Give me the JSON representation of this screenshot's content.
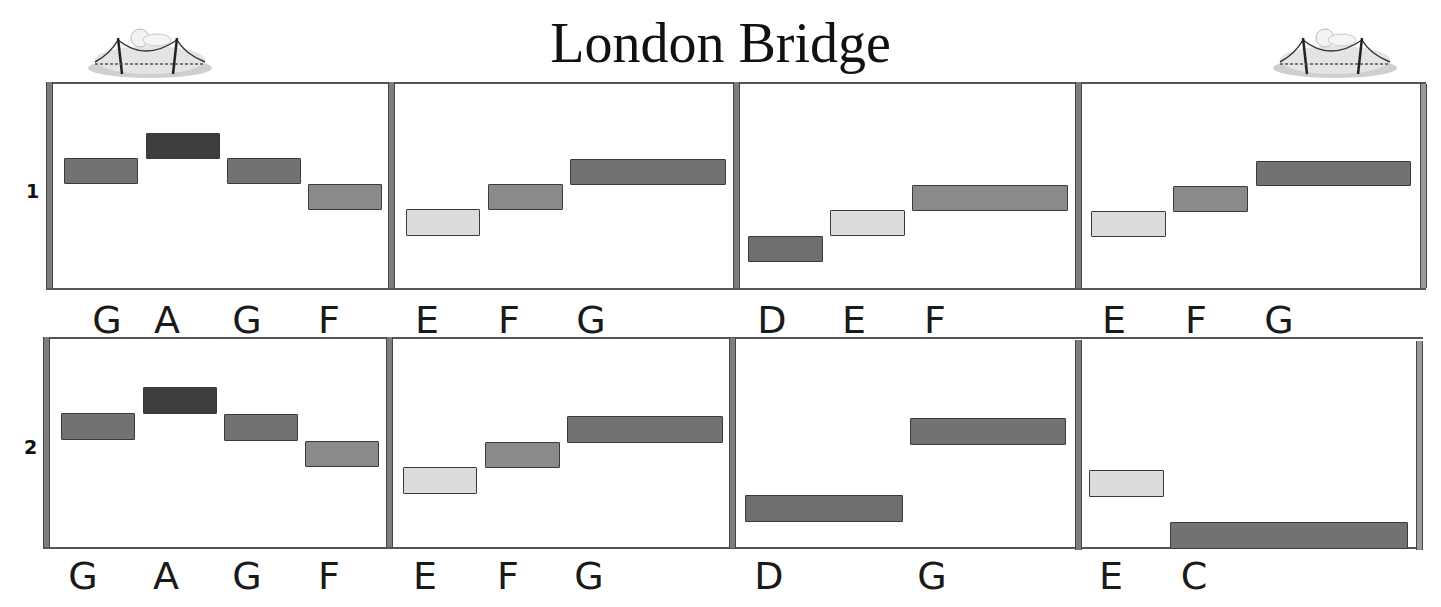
{
  "title": "London Bridge",
  "logos": [
    {
      "name": "bridge-illustration-left",
      "icon": "bridge-icon"
    },
    {
      "name": "bridge-illustration-right",
      "icon": "bridge-icon"
    }
  ],
  "rows": [
    {
      "label": "1",
      "measures": [
        {
          "notes": [
            {
              "pitch": "G",
              "x": 64,
              "y": 158,
              "w": 74,
              "h": 26,
              "shade": "mid"
            },
            {
              "pitch": "A",
              "x": 146,
              "y": 133,
              "w": 74,
              "h": 26,
              "shade": "dark"
            },
            {
              "pitch": "G",
              "x": 227,
              "y": 158,
              "w": 74,
              "h": 26,
              "shade": "mid"
            },
            {
              "pitch": "F",
              "x": 308,
              "y": 184,
              "w": 74,
              "h": 26,
              "shade": "midlight"
            }
          ],
          "labels": [
            {
              "text": "G",
              "x": 96
            },
            {
              "text": "A",
              "x": 156
            },
            {
              "text": "G",
              "x": 236
            },
            {
              "text": "F",
              "x": 318
            }
          ]
        },
        {
          "notes": [
            {
              "pitch": "E",
              "x": 406,
              "y": 209,
              "w": 74,
              "h": 27,
              "shade": "light"
            },
            {
              "pitch": "F",
              "x": 488,
              "y": 184,
              "w": 75,
              "h": 26,
              "shade": "midlight"
            },
            {
              "pitch": "G",
              "x": 570,
              "y": 159,
              "w": 156,
              "h": 26,
              "shade": "mid"
            }
          ],
          "labels": [
            {
              "text": "E",
              "x": 416
            },
            {
              "text": "F",
              "x": 498
            },
            {
              "text": "G",
              "x": 580
            }
          ]
        },
        {
          "notes": [
            {
              "pitch": "D",
              "x": 748,
              "y": 236,
              "w": 75,
              "h": 26,
              "shade": "low"
            },
            {
              "pitch": "E",
              "x": 830,
              "y": 210,
              "w": 75,
              "h": 26,
              "shade": "light"
            },
            {
              "pitch": "F",
              "x": 912,
              "y": 185,
              "w": 156,
              "h": 26,
              "shade": "midlight"
            }
          ],
          "labels": [
            {
              "text": "D",
              "x": 761
            },
            {
              "text": "E",
              "x": 843
            },
            {
              "text": "F",
              "x": 924
            }
          ]
        },
        {
          "notes": [
            {
              "pitch": "E",
              "x": 1091,
              "y": 211,
              "w": 75,
              "h": 26,
              "shade": "light"
            },
            {
              "pitch": "F",
              "x": 1173,
              "y": 186,
              "w": 75,
              "h": 26,
              "shade": "midlight"
            },
            {
              "pitch": "G",
              "x": 1256,
              "y": 161,
              "w": 155,
              "h": 25,
              "shade": "mid"
            }
          ],
          "labels": [
            {
              "text": "E",
              "x": 1103
            },
            {
              "text": "F",
              "x": 1185
            },
            {
              "text": "G",
              "x": 1268
            }
          ]
        }
      ]
    },
    {
      "label": "2",
      "measures": [
        {
          "notes": [
            {
              "pitch": "G",
              "x": 61,
              "y": 413,
              "w": 74,
              "h": 27,
              "shade": "mid"
            },
            {
              "pitch": "A",
              "x": 143,
              "y": 387,
              "w": 74,
              "h": 27,
              "shade": "dark"
            },
            {
              "pitch": "G",
              "x": 224,
              "y": 414,
              "w": 74,
              "h": 27,
              "shade": "mid"
            },
            {
              "pitch": "F",
              "x": 305,
              "y": 441,
              "w": 74,
              "h": 26,
              "shade": "midlight"
            }
          ],
          "labels": [
            {
              "text": "G",
              "x": 72
            },
            {
              "text": "A",
              "x": 155
            },
            {
              "text": "G",
              "x": 236
            },
            {
              "text": "F",
              "x": 318
            }
          ]
        },
        {
          "notes": [
            {
              "pitch": "E",
              "x": 403,
              "y": 467,
              "w": 74,
              "h": 27,
              "shade": "light"
            },
            {
              "pitch": "F",
              "x": 485,
              "y": 442,
              "w": 75,
              "h": 26,
              "shade": "midlight"
            },
            {
              "pitch": "G",
              "x": 567,
              "y": 416,
              "w": 156,
              "h": 27,
              "shade": "mid"
            }
          ],
          "labels": [
            {
              "text": "E",
              "x": 414
            },
            {
              "text": "F",
              "x": 497
            },
            {
              "text": "G",
              "x": 578
            }
          ]
        },
        {
          "notes": [
            {
              "pitch": "D",
              "x": 745,
              "y": 495,
              "w": 158,
              "h": 27,
              "shade": "low"
            },
            {
              "pitch": "G",
              "x": 910,
              "y": 418,
              "w": 156,
              "h": 27,
              "shade": "mid"
            }
          ],
          "labels": [
            {
              "text": "D",
              "x": 758
            },
            {
              "text": "G",
              "x": 921
            }
          ]
        },
        {
          "notes": [
            {
              "pitch": "E",
              "x": 1089,
              "y": 470,
              "w": 75,
              "h": 27,
              "shade": "light"
            },
            {
              "pitch": "C",
              "x": 1170,
              "y": 522,
              "w": 238,
              "h": 27,
              "shade": "mid"
            }
          ],
          "labels": [
            {
              "text": "E",
              "x": 1100
            },
            {
              "text": "C",
              "x": 1183
            }
          ]
        }
      ]
    }
  ]
}
